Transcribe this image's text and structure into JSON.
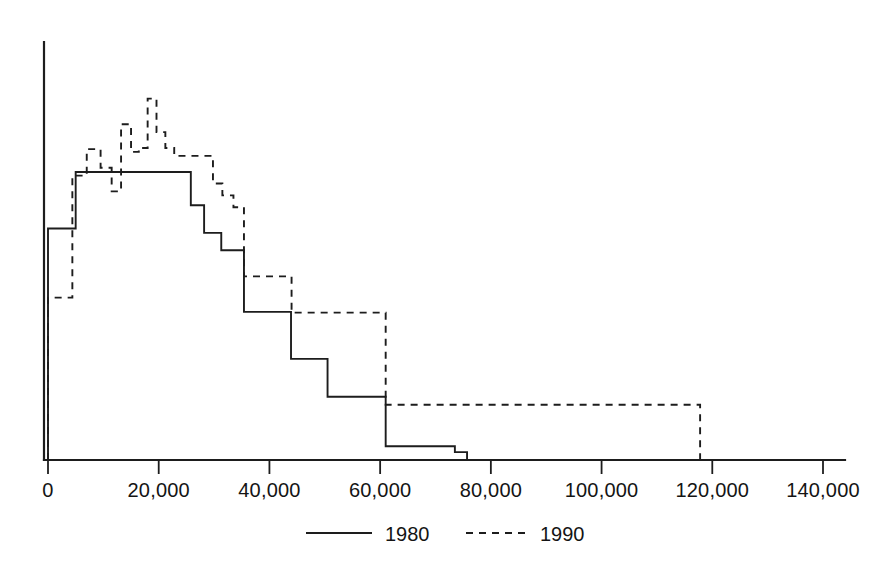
{
  "chart_data": {
    "type": "line",
    "title": "",
    "subtitle": "",
    "xlabel": "",
    "ylabel": "",
    "grid": false,
    "legend_position": "bottom-center",
    "xlim": [
      0,
      145000
    ],
    "ylim": [
      0,
      100
    ],
    "xticks": [
      0,
      20000,
      40000,
      60000,
      80000,
      100000,
      120000,
      140000
    ],
    "xtick_labels": [
      "0",
      "20,000",
      "40,000",
      "60,000",
      "80,000",
      "100,000",
      "120,000",
      "140,000"
    ],
    "yticks": [],
    "ytick_labels": [],
    "series": [
      {
        "name": "1980",
        "style": "solid",
        "color": "#1d1d1d",
        "bin_edges": [
          0,
          2200,
          5000,
          8200,
          11300,
          14500,
          17700,
          20800,
          24000,
          25800,
          28200,
          31300,
          35400,
          43900,
          50500,
          61000,
          73500,
          75700
        ],
        "values": [
          58.6,
          58.6,
          72.9,
          72.9,
          72.9,
          72.9,
          72.9,
          72.9,
          72.9,
          64.5,
          57.5,
          53.1,
          37.5,
          25.6,
          16.0,
          3.5,
          2.0
        ]
      },
      {
        "name": "1990",
        "style": "dashed",
        "color": "#1d1d1d",
        "bin_edges": [
          0,
          4400,
          7000,
          9500,
          11500,
          13200,
          15000,
          16400,
          18000,
          19600,
          21200,
          22800,
          24600,
          26300,
          28000,
          29800,
          31500,
          33500,
          35400,
          44000,
          61000,
          117800
        ],
        "values": [
          41.1,
          72.0,
          78.7,
          74.0,
          68.0,
          85.0,
          78.0,
          79.0,
          91.5,
          83.0,
          79.0,
          77.0,
          77.0,
          77.0,
          77.0,
          70.0,
          67.0,
          64.0,
          46.5,
          37.3,
          14.0
        ]
      }
    ],
    "legend": [
      {
        "label": "1980",
        "style": "solid"
      },
      {
        "label": "1990",
        "style": "dashed"
      }
    ]
  },
  "axis": {
    "tick_0": "0",
    "tick_20000": "20,000",
    "tick_40000": "40,000",
    "tick_60000": "60,000",
    "tick_80000": "80,000",
    "tick_100000": "100,000",
    "tick_120000": "120,000",
    "tick_140000": "140,000"
  },
  "legend": {
    "item_1980": "1980",
    "item_1990": "1990"
  },
  "colors": {
    "ink": "#1d1d1d",
    "background": "#ffffff"
  }
}
